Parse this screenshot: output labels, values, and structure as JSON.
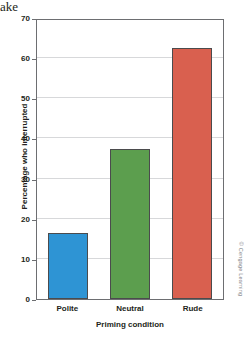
{
  "page": {
    "text_fragment_above_figure": "ake"
  },
  "credit": "© Cengage Learning",
  "chart_data": {
    "type": "bar",
    "title": "",
    "subtitle": "",
    "xlabel": "Priming condition",
    "ylabel": "Percentage who interrupted",
    "categories": [
      "Polite",
      "Neutral",
      "Rude"
    ],
    "values": [
      16.4,
      37.4,
      62.5
    ],
    "series": [
      {
        "name": "Percentage who interrupted",
        "values": [
          16.4,
          37.4,
          62.5
        ]
      }
    ],
    "bar_colors": [
      "#2e94d4",
      "#5c9e4e",
      "#d9604f"
    ],
    "bar_edge_color": "#4b4b4d",
    "ylim": [
      0,
      70
    ],
    "xlim_categories": 3,
    "y_ticks": [
      0,
      10,
      20,
      30,
      40,
      50,
      60,
      70
    ],
    "y_tick_labels": [
      "0",
      "10",
      "20",
      "30",
      "40",
      "50",
      "60",
      "70"
    ],
    "grid": "horizontal",
    "gridline_color": "#d7d8da",
    "legend": "none",
    "legend_position": "none",
    "frame_color": "#6d6e71",
    "plot_background": "#ffffff",
    "annotations": []
  }
}
